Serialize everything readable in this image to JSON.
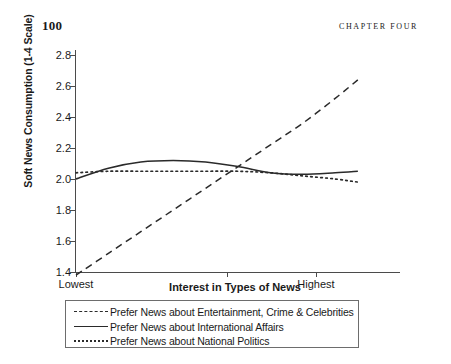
{
  "page": {
    "number": "100",
    "running_head": "CHAPTER FOUR"
  },
  "chart_data": {
    "type": "line",
    "title": "",
    "xlabel": "Interest in Types of News",
    "ylabel": "Soft News Consumption (1-4 Scale)",
    "ylim": [
      1.4,
      2.8
    ],
    "yticks": [
      "2.8",
      "2.6",
      "2.4",
      "2.2",
      "2.0",
      "1.8",
      "1.6",
      "1.4"
    ],
    "xlim": [
      0,
      1
    ],
    "xticks": [
      "Lowest",
      "",
      "Highest"
    ],
    "xtick_positions": [
      0.0,
      0.465,
      0.74
    ],
    "grid": false,
    "legend_position": "below-axes",
    "x": [
      0.0,
      0.1,
      0.2,
      0.3,
      0.4,
      0.5,
      0.6,
      0.7,
      0.8,
      0.87
    ],
    "series": [
      {
        "name": "Prefer News about Entertainment, Crime & Celebrities",
        "style": "dashed",
        "color": "#2a2a2a",
        "values": [
          1.38,
          1.52,
          1.66,
          1.8,
          1.94,
          2.08,
          2.22,
          2.36,
          2.52,
          2.64
        ]
      },
      {
        "name": "Prefer News about International Affairs",
        "style": "solid",
        "color": "#2a2a2a",
        "values": [
          2.0,
          2.07,
          2.11,
          2.12,
          2.11,
          2.08,
          2.04,
          2.03,
          2.04,
          2.05
        ]
      },
      {
        "name": "Prefer News about National Politics",
        "style": "dotted",
        "color": "#2a2a2a",
        "values": [
          2.04,
          2.05,
          2.05,
          2.05,
          2.05,
          2.05,
          2.04,
          2.02,
          2.0,
          1.98
        ]
      }
    ]
  },
  "legend": {
    "items": [
      {
        "label": "Prefer News about Entertainment, Crime & Celebrities",
        "style": "dashed"
      },
      {
        "label": "Prefer News about International Affairs",
        "style": "solid"
      },
      {
        "label": "Prefer News about National Politics",
        "style": "dotted"
      }
    ]
  }
}
